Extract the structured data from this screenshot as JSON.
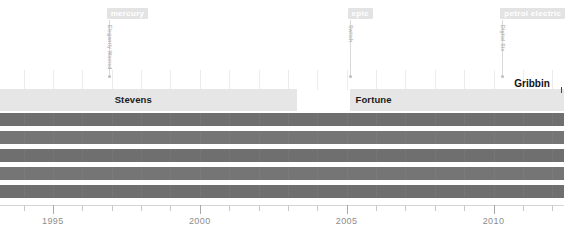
{
  "chart_data": {
    "type": "bar",
    "title": "",
    "xlabel": "",
    "ylabel": "",
    "xlim": [
      1993.2,
      2012.4
    ],
    "grid": true,
    "legend": false,
    "tick_labels": [
      "1995",
      "2000",
      "2005",
      "2010"
    ],
    "tick_values": [
      1995,
      2000,
      2005,
      2010
    ],
    "minor_tick_values": [
      1994,
      1996,
      1997,
      1998,
      1999,
      2001,
      2002,
      2003,
      2004,
      2006,
      2007,
      2008,
      2009,
      2011,
      2012
    ],
    "markers": [
      {
        "tag": "mercury",
        "vertical_label": "Elegantly Wasted",
        "x": 1996.9
      },
      {
        "tag": "epic",
        "vertical_label": "Switch",
        "x": 2005.1
      },
      {
        "tag": "petrol electric",
        "vertical_label": "Digital Six",
        "x": 2010.3
      }
    ],
    "eras": [
      {
        "label": "",
        "start": 1993.2,
        "end": 1996.9
      },
      {
        "label": "Stevens",
        "start": 1996.9,
        "end": 2003.3
      },
      {
        "label": "Fortune",
        "start": 2005.1,
        "end": 2010.3
      },
      {
        "label": "",
        "start": 2010.3,
        "end": 2012.4
      }
    ],
    "callouts": [
      {
        "label": "Gribbin",
        "x": 2010.3
      }
    ],
    "series": [
      {
        "name": "row-1",
        "color": "#6f6f6f",
        "start": 1993.2,
        "end": 2012.4
      },
      {
        "name": "row-2",
        "color": "#757575",
        "start": 1993.2,
        "end": 2012.4
      },
      {
        "name": "row-3",
        "color": "#6f6f6f",
        "start": 1993.2,
        "end": 2012.4
      },
      {
        "name": "row-4",
        "color": "#757575",
        "start": 1993.2,
        "end": 2012.4
      },
      {
        "name": "row-5",
        "color": "#6f6f6f",
        "start": 1993.2,
        "end": 2012.4
      }
    ]
  },
  "colors": {
    "background": "#ffffff",
    "tag_background": "#e3e3e3",
    "tag_text": "#ffffff",
    "band_background": "#e6e6e6",
    "band_text": "#1a1a1a",
    "bar_dark": "#6f6f6f",
    "bar_light": "#757575",
    "axis_text": "#8d8d8d",
    "leader": "#d9d9d9"
  }
}
